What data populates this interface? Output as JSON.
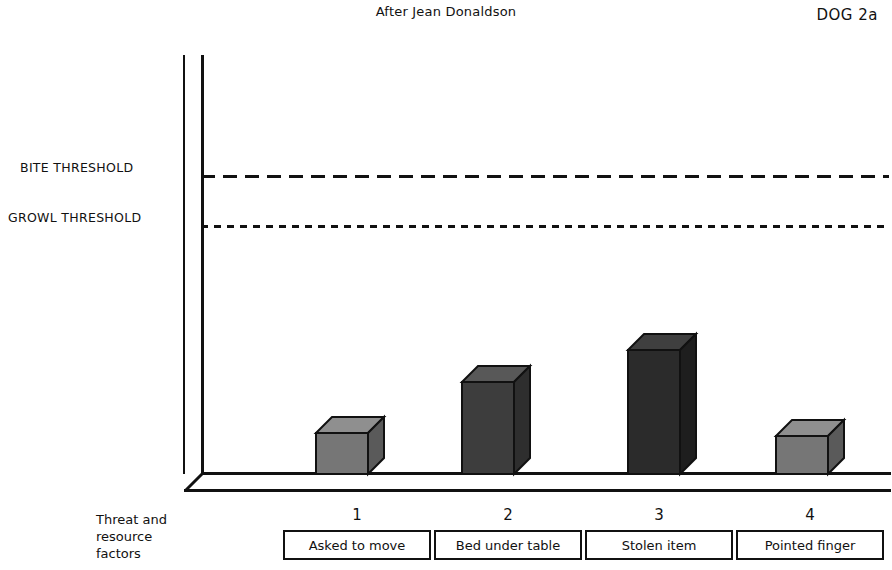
{
  "header": {
    "title": "After Jean Donaldson",
    "code": "DOG 2a"
  },
  "axis": {
    "caption_line1": "Threat and",
    "caption_line2": "resource",
    "caption_line3": "factors"
  },
  "thresholds": [
    {
      "name": "bite",
      "label": "BITE THRESHOLD",
      "y_px": 175,
      "dash": "long"
    },
    {
      "name": "growl",
      "label": "GROWL THRESHOLD",
      "y_px": 225,
      "dash": "short"
    }
  ],
  "chart_data": {
    "type": "bar",
    "title": "After Jean Donaldson",
    "subtitle": "DOG 2a",
    "xlabel": "Threat and resource factors",
    "ylabel": "",
    "grid": false,
    "legend": false,
    "categories": [
      "1",
      "2",
      "3",
      "4"
    ],
    "category_labels": [
      "Asked to move",
      "Bed under table",
      "Stolen item",
      "Pointed finger"
    ],
    "values": [
      14,
      30,
      41,
      13
    ],
    "ylim": [
      0,
      100
    ],
    "annotations": [
      {
        "label": "GROWL THRESHOLD",
        "value": 83
      },
      {
        "label": "BITE THRESHOLD",
        "value": 100
      }
    ],
    "bar_colors": [
      "#767676",
      "#3d3d3d",
      "#2b2b2b",
      "#767676"
    ],
    "note": "Bar heights are below both the growl and bite thresholds; bar 3 (Stolen item) is tallest."
  },
  "bars": [
    {
      "index": "1",
      "label": "Asked to move",
      "front_color": "#767676",
      "top_color": "#8f8f8f",
      "side_color": "#5a5a5a",
      "left_px": 316,
      "width_px": 52,
      "top_px": 433
    },
    {
      "index": "2",
      "label": "Bed under table",
      "front_color": "#3d3d3d",
      "top_color": "#585858",
      "side_color": "#2e2e2e",
      "left_px": 462,
      "width_px": 52,
      "top_px": 382
    },
    {
      "index": "3",
      "label": "Stolen item",
      "front_color": "#2b2b2b",
      "top_color": "#3f3f3f",
      "side_color": "#1e1e1e",
      "left_px": 628,
      "width_px": 52,
      "top_px": 350
    },
    {
      "index": "4",
      "label": "Pointed finger",
      "front_color": "#767676",
      "top_color": "#8f8f8f",
      "side_color": "#5a5a5a",
      "left_px": 776,
      "width_px": 52,
      "top_px": 436
    }
  ]
}
